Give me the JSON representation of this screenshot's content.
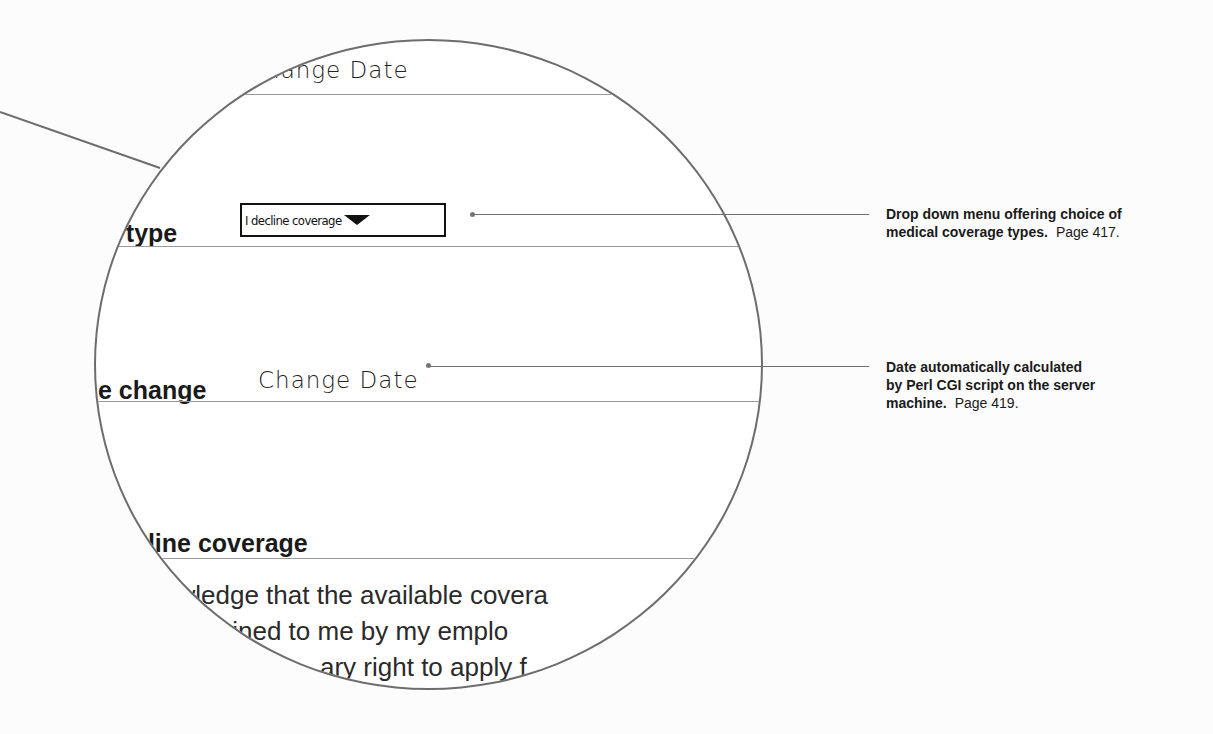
{
  "magnifier": {
    "top_field_value": "Change Date",
    "coverage_type_label": "e type",
    "coverage_dropdown": {
      "selected": "I decline coverage",
      "icon": "triangle-down-icon"
    },
    "date_change_label": "e change",
    "date_change_value": "Change Date",
    "decline_heading": "cline coverage",
    "decline_body_lines": [
      "owledge that the available covera",
      "lained to me by my emplo",
      "ary right to apply f"
    ]
  },
  "callouts": [
    {
      "text_bold_line1": "Drop down menu offering choice of",
      "text_bold_line2": "medical coverage types.",
      "page": "Page 417."
    },
    {
      "text_bold_line1": "Date automatically calculated",
      "text_bold_line2": "by Perl CGI script on the server",
      "text_bold_line3": "machine.",
      "page": "Page 419."
    }
  ],
  "colors": {
    "background": "#fcfcfc",
    "lens_border": "#6d6d6d",
    "rule": "#9a9a9a"
  }
}
